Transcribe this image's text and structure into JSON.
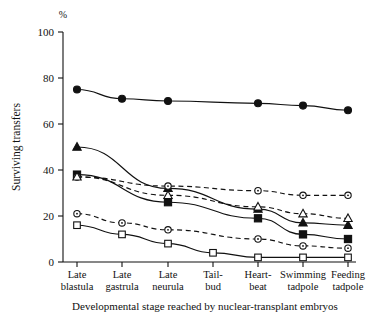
{
  "chart_data": {
    "type": "line",
    "title": "",
    "xlabel": "Developmental stage reached by nuclear-transplant embryos",
    "ylabel": "Surviving transfers",
    "yunit": "%",
    "ylim": [
      0,
      100
    ],
    "yticks": [
      0,
      20,
      40,
      60,
      80,
      100
    ],
    "ytick_labels": [
      "0",
      "20",
      "40",
      "60",
      "80",
      "100"
    ],
    "grid": false,
    "legend": "none",
    "categories": [
      "Late blastula",
      "Late gastrula",
      "Late neurula",
      "Tail-bud",
      "Heart-beat",
      "Swimming tadpole",
      "Feeding tadpole"
    ],
    "category_lines": [
      [
        "Late",
        "blastula"
      ],
      [
        "Late",
        "gastrula"
      ],
      [
        "Late",
        "neurula"
      ],
      [
        "Tail-",
        "bud"
      ],
      [
        "Heart-",
        "beat"
      ],
      [
        "Swimming",
        "tadpole"
      ],
      [
        "Feeding",
        "tadpole"
      ]
    ],
    "series": [
      {
        "name": "filled-circle",
        "marker": "filled-circle",
        "line": "solid",
        "x": [
          "Late blastula",
          "Late gastrula",
          "Late neurula",
          "Heart-beat",
          "Swimming tadpole",
          "Feeding tadpole"
        ],
        "values": [
          75,
          71,
          70,
          69,
          68,
          66
        ]
      },
      {
        "name": "filled-triangle",
        "marker": "filled-triangle",
        "line": "solid",
        "x": [
          "Late blastula",
          "Late neurula",
          "Heart-beat",
          "Swimming tadpole",
          "Feeding tadpole"
        ],
        "values": [
          50,
          32,
          23,
          17,
          16
        ]
      },
      {
        "name": "filled-square",
        "marker": "filled-square",
        "line": "solid",
        "x": [
          "Late blastula",
          "Late neurula",
          "Heart-beat",
          "Swimming tadpole",
          "Feeding tadpole"
        ],
        "values": [
          38,
          26,
          19,
          12,
          10
        ]
      },
      {
        "name": "open-circle",
        "marker": "open-circle",
        "line": "dashed",
        "x": [
          "Late blastula",
          "Late neurula",
          "Heart-beat",
          "Swimming tadpole",
          "Feeding tadpole"
        ],
        "values": [
          37,
          33,
          31,
          29,
          29
        ]
      },
      {
        "name": "open-triangle",
        "marker": "open-triangle",
        "line": "dashed",
        "x": [
          "Late blastula",
          "Late neurula",
          "Heart-beat",
          "Swimming tadpole",
          "Feeding tadpole"
        ],
        "values": [
          37,
          29,
          24,
          21,
          19
        ]
      },
      {
        "name": "open-circle-low",
        "marker": "open-circle",
        "line": "dashed",
        "x": [
          "Late blastula",
          "Late gastrula",
          "Late neurula",
          "Heart-beat",
          "Swimming tadpole",
          "Feeding tadpole"
        ],
        "values": [
          21,
          17,
          14,
          10,
          7,
          6
        ]
      },
      {
        "name": "open-square",
        "marker": "open-square",
        "line": "solid",
        "x": [
          "Late blastula",
          "Late gastrula",
          "Late neurula",
          "Tail-bud",
          "Heart-beat",
          "Swimming tadpole",
          "Feeding tadpole"
        ],
        "values": [
          16,
          12,
          8,
          4,
          2,
          2,
          2
        ]
      }
    ],
    "colors": {
      "line": "#111111",
      "marker_fill": "#111111",
      "marker_open": "#ffffff",
      "background": "#ffffff"
    }
  }
}
